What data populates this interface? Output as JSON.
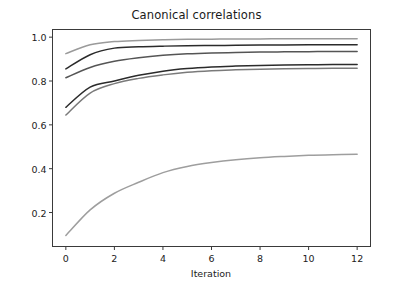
{
  "chart_data": {
    "type": "line",
    "title": "Canonical correlations",
    "xlabel": "Iteration",
    "ylabel": "",
    "xlim": [
      -0.55,
      12.55
    ],
    "ylim": [
      0.045,
      1.035
    ],
    "xticks": [
      0,
      2,
      4,
      6,
      8,
      10,
      12
    ],
    "xtick_labels": [
      "0",
      "2",
      "4",
      "6",
      "8",
      "10",
      "12"
    ],
    "yticks": [
      0.2,
      0.4,
      0.6,
      0.8,
      1.0
    ],
    "ytick_labels": [
      "0.2",
      "0.4",
      "0.6",
      "0.8",
      "1.0"
    ],
    "grid": false,
    "legend": null,
    "x": [
      0,
      1,
      2,
      3,
      4,
      5,
      6,
      7,
      8,
      9,
      10,
      11,
      12
    ],
    "series": [
      {
        "name": "correlation-1",
        "color": "#9a9a9a",
        "values": [
          0.925,
          0.965,
          0.98,
          0.985,
          0.988,
          0.99,
          0.991,
          0.992,
          0.992,
          0.993,
          0.993,
          0.993,
          0.993
        ]
      },
      {
        "name": "correlation-2",
        "color": "#2b2b2b",
        "values": [
          0.855,
          0.92,
          0.95,
          0.956,
          0.959,
          0.961,
          0.962,
          0.963,
          0.964,
          0.964,
          0.965,
          0.965,
          0.965
        ]
      },
      {
        "name": "correlation-3",
        "color": "#555555",
        "values": [
          0.815,
          0.862,
          0.89,
          0.906,
          0.917,
          0.924,
          0.928,
          0.93,
          0.932,
          0.933,
          0.934,
          0.935,
          0.935
        ]
      },
      {
        "name": "correlation-4",
        "color": "#2b2b2b",
        "values": [
          0.68,
          0.772,
          0.8,
          0.826,
          0.845,
          0.857,
          0.864,
          0.868,
          0.871,
          0.873,
          0.874,
          0.875,
          0.875
        ]
      },
      {
        "name": "correlation-5",
        "color": "#7a7a7a",
        "values": [
          0.645,
          0.745,
          0.788,
          0.812,
          0.828,
          0.84,
          0.847,
          0.851,
          0.854,
          0.856,
          0.857,
          0.858,
          0.858
        ]
      },
      {
        "name": "correlation-6",
        "color": "#9e9e9e",
        "values": [
          0.095,
          0.212,
          0.288,
          0.338,
          0.382,
          0.41,
          0.428,
          0.441,
          0.45,
          0.456,
          0.461,
          0.464,
          0.466
        ]
      }
    ]
  },
  "axes": {
    "frame_color": "#3a3a3a",
    "tick_color": "#3a3a3a"
  }
}
